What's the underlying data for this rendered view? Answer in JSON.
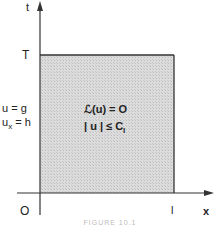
{
  "diagram": {
    "axes": {
      "vertical_label": "t",
      "horizontal_label": "x",
      "origin_label": "O",
      "t_tick_label": "T",
      "x_tick_label": "l"
    },
    "boundary_conditions": {
      "line1": "u = g",
      "line2_base": "u",
      "line2_sub": "x",
      "line2_rest": " = h"
    },
    "region": {
      "equation": "ℒ(u) = O",
      "constraint_base": "| u | ≤ C",
      "constraint_sub": "l",
      "fill_color": "#d9d9d9"
    },
    "caption": "FIGURE 10.1"
  }
}
